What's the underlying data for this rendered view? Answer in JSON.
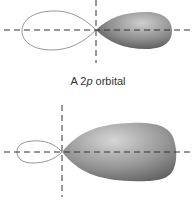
{
  "figures": [
    {
      "id": "2p-orbital",
      "caption_prefix": "A 2",
      "caption_italic": "p",
      "caption_suffix": " orbital"
    },
    {
      "id": "hybrid-orbital",
      "caption_prefix": "",
      "caption_italic": "",
      "caption_suffix": ""
    }
  ],
  "colors": {
    "lobe_outline": "#8a8a8a",
    "lobe_fill_light": "#c8c8c8",
    "lobe_fill_dark": "#5a5a5a",
    "axis": "#333333"
  }
}
